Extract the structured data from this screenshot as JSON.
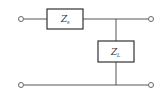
{
  "diagram": {
    "type": "circuit-two-port-L-network",
    "series_impedance": {
      "symbol": "Z",
      "subscript": "s"
    },
    "shunt_impedance": {
      "symbol": "Z",
      "subscript": "L"
    },
    "terminals": [
      "input-top",
      "input-bottom",
      "output-top",
      "output-bottom"
    ],
    "colors": {
      "wire": "#555555",
      "box": "#333333",
      "background": "#ffffff"
    }
  }
}
